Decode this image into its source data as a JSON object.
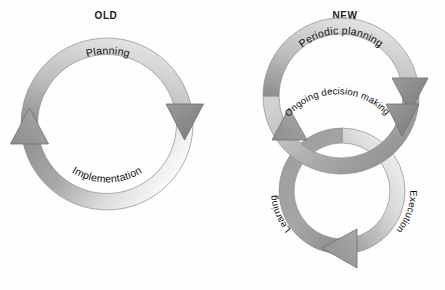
{
  "canvas": {
    "width": 445,
    "height": 290,
    "background": "#fefefe"
  },
  "diagrams": [
    {
      "id": "old",
      "title": "OLD",
      "type": "single-cycle",
      "labels": [
        {
          "name": "planning",
          "text": "Planning",
          "position": "top-arc"
        },
        {
          "name": "implementation",
          "text": "Implementation",
          "position": "bottom-arc"
        }
      ],
      "arrows": [
        {
          "name": "arrow-down-right",
          "direction": "down",
          "position": "right"
        },
        {
          "name": "arrow-up-left",
          "direction": "up",
          "position": "left"
        }
      ]
    },
    {
      "id": "new",
      "title": "NEW",
      "type": "double-cycle",
      "labels": [
        {
          "name": "periodic-planning",
          "text": "Periodic planning",
          "position": "upper-ring-top"
        },
        {
          "name": "ongoing-decision-making",
          "text": "Ongoing decision making",
          "position": "upper-ring-bottom"
        },
        {
          "name": "learning",
          "text": "Learning",
          "position": "lower-ring-left"
        },
        {
          "name": "execution",
          "text": "Execution",
          "position": "lower-ring-right"
        }
      ],
      "arrows": [
        {
          "name": "arrow-upper-right",
          "direction": "down",
          "position": "upper-ring-right"
        },
        {
          "name": "arrow-upper-left",
          "direction": "left",
          "position": "upper-ring-left"
        },
        {
          "name": "arrow-lower-right",
          "direction": "down",
          "position": "lower-ring-right"
        },
        {
          "name": "arrow-lower-bottom",
          "direction": "left",
          "position": "lower-ring-bottom"
        }
      ]
    }
  ],
  "colors": {
    "band_dark": "#8a8a8a",
    "band_mid": "#b4b4b4",
    "band_light": "#d9d9d9",
    "band_highlight": "#f6f6f6",
    "outline": "#6f6f6f",
    "text": "#111111",
    "title_text": "#1a1a1a"
  }
}
